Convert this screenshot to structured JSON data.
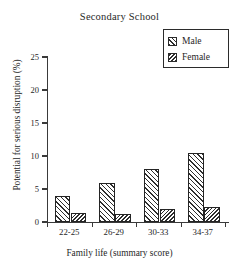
{
  "chart_data": {
    "type": "bar",
    "title": "Secondary School",
    "xlabel": "Family life (summary score)",
    "ylabel": "Potential for serious disruption (%)",
    "categories": [
      "22-25",
      "26-29",
      "30-33",
      "34-37"
    ],
    "series": [
      {
        "name": "Male",
        "values": [
          4.0,
          5.9,
          8.1,
          10.4
        ],
        "hatch": "forward-diagonal",
        "color": "#2e2e2e"
      },
      {
        "name": "Female",
        "values": [
          1.4,
          1.2,
          2.0,
          2.3
        ],
        "hatch": "backward-diagonal",
        "color": "#2e2e2e"
      }
    ],
    "ylim": [
      0,
      25
    ],
    "yticks": [
      0,
      5,
      10,
      15,
      20,
      25
    ],
    "ytick_labels": [
      "0",
      "5",
      "10",
      "15",
      "20",
      "25"
    ],
    "grid": false,
    "legend_position": "top-right",
    "frame": "left-and-bottom-spines"
  },
  "legend": {
    "entries": [
      {
        "label": "Male",
        "swatch": "male-hatch-swatch"
      },
      {
        "label": "Female",
        "swatch": "female-hatch-swatch"
      }
    ]
  }
}
